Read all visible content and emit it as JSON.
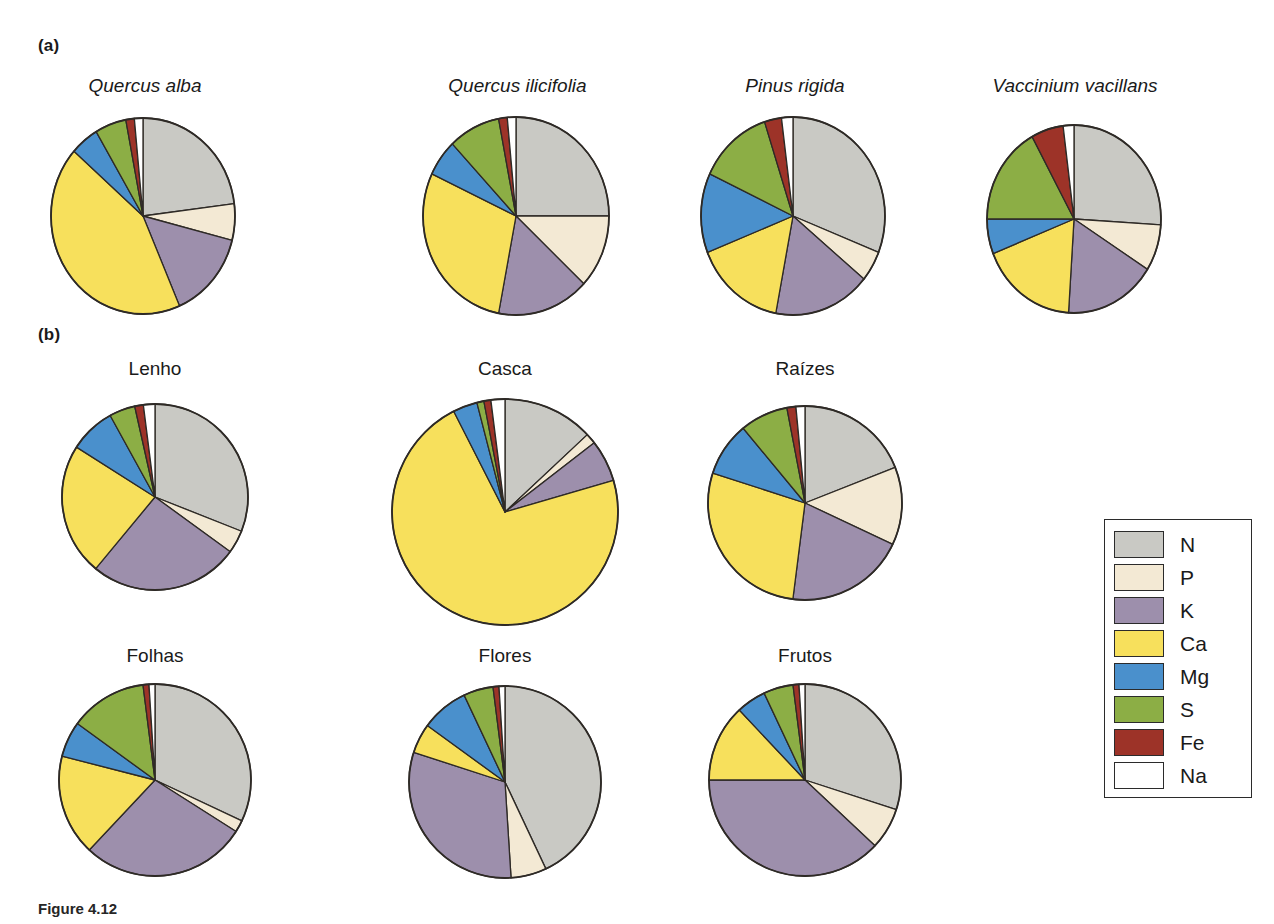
{
  "figure": {
    "panel_a_label": "(a)",
    "panel_b_label": "(b)",
    "caption_prefix": "Figure 4.12",
    "caption_text": ""
  },
  "legend": {
    "title": "",
    "items": [
      {
        "label": "N",
        "color": "#c9c9c4"
      },
      {
        "label": "P",
        "color": "#f3e9d4"
      },
      {
        "label": "K",
        "color": "#9d8fac"
      },
      {
        "label": "Ca",
        "color": "#f7e05c"
      },
      {
        "label": "Mg",
        "color": "#4a90cc"
      },
      {
        "label": "S",
        "color": "#8cae45"
      },
      {
        "label": "Fe",
        "color": "#9d3328"
      },
      {
        "label": "Na",
        "color": "#ffffff"
      }
    ]
  },
  "chart_data": [
    {
      "type": "pie",
      "panel": "a",
      "title": "Quercus alba",
      "title_style": "italic",
      "categories": [
        "N",
        "P",
        "K",
        "Ca",
        "Mg",
        "S",
        "Fe",
        "Na"
      ],
      "values": [
        23.0,
        6.0,
        14.5,
        43.0,
        5.0,
        5.5,
        1.5,
        1.5
      ],
      "units": "percent",
      "start_angle": 0
    },
    {
      "type": "pie",
      "panel": "a",
      "title": "Quercus ilicifolia",
      "title_style": "italic",
      "categories": [
        "N",
        "P",
        "K",
        "Ca",
        "Mg",
        "S",
        "Fe",
        "Na"
      ],
      "values": [
        25.0,
        12.0,
        16.0,
        29.0,
        6.0,
        9.0,
        1.5,
        1.5
      ],
      "units": "percent",
      "start_angle": 0
    },
    {
      "type": "pie",
      "panel": "a",
      "title": "Pinus rigida",
      "title_style": "italic",
      "categories": [
        "N",
        "P",
        "K",
        "Ca",
        "Mg",
        "S",
        "Fe",
        "Na"
      ],
      "values": [
        31.0,
        5.0,
        17.0,
        16.0,
        13.0,
        13.0,
        3.0,
        2.0
      ],
      "units": "percent",
      "start_angle": 0
    },
    {
      "type": "pie",
      "panel": "a",
      "title": "Vaccinium vacillans",
      "title_style": "italic",
      "categories": [
        "N",
        "P",
        "K",
        "Ca",
        "Mg",
        "S",
        "Fe",
        "Na"
      ],
      "values": [
        26.0,
        8.0,
        17.0,
        18.0,
        6.0,
        17.0,
        6.0,
        2.0
      ],
      "units": "percent",
      "start_angle": 0
    },
    {
      "type": "pie",
      "panel": "b",
      "title": "Lenho",
      "title_style": "normal",
      "categories": [
        "N",
        "P",
        "K",
        "Ca",
        "Mg",
        "S",
        "Fe",
        "Na"
      ],
      "values": [
        31.0,
        4.0,
        26.0,
        23.0,
        8.0,
        4.5,
        1.5,
        2.0
      ],
      "units": "percent",
      "start_angle": 0
    },
    {
      "type": "pie",
      "panel": "b",
      "title": "Casca",
      "title_style": "normal",
      "categories": [
        "N",
        "P",
        "K",
        "Ca",
        "Mg",
        "S",
        "Fe",
        "Na"
      ],
      "values": [
        13.0,
        1.5,
        6.0,
        72.0,
        3.5,
        1.0,
        1.0,
        2.0
      ],
      "units": "percent",
      "start_angle": 0
    },
    {
      "type": "pie",
      "panel": "b",
      "title": "Raízes",
      "title_style": "normal",
      "categories": [
        "N",
        "P",
        "K",
        "Ca",
        "Mg",
        "S",
        "Fe",
        "Na"
      ],
      "values": [
        19.0,
        13.0,
        20.0,
        28.0,
        9.0,
        8.0,
        1.5,
        1.5
      ],
      "units": "percent",
      "start_angle": 0
    },
    {
      "type": "pie",
      "panel": "b",
      "title": "Folhas",
      "title_style": "normal",
      "categories": [
        "N",
        "P",
        "K",
        "Ca",
        "Mg",
        "S",
        "Fe",
        "Na"
      ],
      "values": [
        32.0,
        2.0,
        28.0,
        17.0,
        6.0,
        13.0,
        1.0,
        1.0
      ],
      "units": "percent",
      "start_angle": 0
    },
    {
      "type": "pie",
      "panel": "b",
      "title": "Flores",
      "title_style": "normal",
      "categories": [
        "N",
        "P",
        "K",
        "Ca",
        "Mg",
        "S",
        "Fe",
        "Na"
      ],
      "values": [
        43.0,
        6.0,
        31.0,
        5.0,
        8.0,
        5.0,
        1.0,
        1.0
      ],
      "units": "percent",
      "start_angle": 0
    },
    {
      "type": "pie",
      "panel": "b",
      "title": "Frutos",
      "title_style": "normal",
      "categories": [
        "N",
        "P",
        "K",
        "Ca",
        "Mg",
        "S",
        "Fe",
        "Na"
      ],
      "values": [
        30.0,
        7.0,
        38.0,
        13.0,
        5.0,
        5.0,
        1.0,
        1.0
      ],
      "units": "percent",
      "start_angle": 0
    }
  ],
  "layout": {
    "panel_a": [
      {
        "cx": 143,
        "cy": 216,
        "rx": 92,
        "ry": 98,
        "title_x": 50,
        "title_y": 75,
        "title_w": 190
      },
      {
        "cx": 516,
        "cy": 216,
        "rx": 93,
        "ry": 99,
        "title_x": 420,
        "title_y": 75,
        "title_w": 195
      },
      {
        "cx": 793,
        "cy": 216,
        "rx": 92,
        "ry": 99,
        "title_x": 700,
        "title_y": 75,
        "title_w": 190
      },
      {
        "cx": 1074,
        "cy": 219,
        "rx": 87,
        "ry": 94,
        "title_x": 975,
        "title_y": 75,
        "title_w": 200
      }
    ],
    "panel_b": [
      {
        "cx": 155,
        "cy": 497,
        "rx": 93,
        "ry": 93,
        "title_x": 60,
        "title_y": 358,
        "title_w": 190
      },
      {
        "cx": 505,
        "cy": 512,
        "rx": 113,
        "ry": 113,
        "title_x": 410,
        "title_y": 358,
        "title_w": 190
      },
      {
        "cx": 805,
        "cy": 503,
        "rx": 97,
        "ry": 97,
        "title_x": 710,
        "title_y": 358,
        "title_w": 190
      },
      {
        "cx": 155,
        "cy": 780,
        "rx": 96,
        "ry": 96,
        "title_x": 60,
        "title_y": 645,
        "title_w": 190
      },
      {
        "cx": 505,
        "cy": 782,
        "rx": 96,
        "ry": 96,
        "title_x": 410,
        "title_y": 645,
        "title_w": 190
      },
      {
        "cx": 805,
        "cy": 780,
        "rx": 96,
        "ry": 96,
        "title_x": 710,
        "title_y": 645,
        "title_w": 190
      }
    ]
  }
}
